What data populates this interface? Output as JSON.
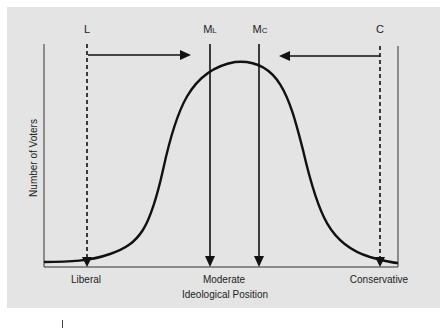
{
  "diagram": {
    "title": "",
    "y_axis_label": "Number of Voters",
    "x_axis_label": "Ideological Position",
    "x_categories": [
      {
        "label": "Liberal",
        "x": 86
      },
      {
        "label": "Moderate",
        "x": 224
      },
      {
        "label": "Conservative",
        "x": 379
      }
    ],
    "markers": [
      {
        "id": "L",
        "label": "L",
        "x": 87,
        "style": "dashed",
        "direction": "down"
      },
      {
        "id": "ML",
        "label_main": "M",
        "label_sub": "L",
        "x": 210,
        "style": "solid",
        "direction": "down"
      },
      {
        "id": "MC",
        "label_main": "M",
        "label_sub": "C",
        "x": 259,
        "style": "solid",
        "direction": "down"
      },
      {
        "id": "C",
        "label": "C",
        "x": 380,
        "style": "dashed",
        "direction": "down"
      }
    ],
    "shift_arrows": [
      {
        "from": "L",
        "to": "ML",
        "y": 55
      },
      {
        "from": "C",
        "to": "MC",
        "y": 55
      }
    ],
    "curve": "normal distribution of voters peaking at center",
    "colors": {
      "panel_background": "#e4e4e4",
      "line": "#111111",
      "text": "#222222"
    }
  }
}
